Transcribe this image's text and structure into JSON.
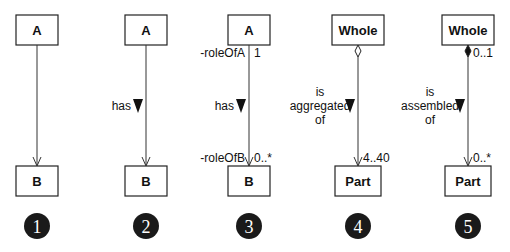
{
  "diagram": {
    "type": "UML association variants",
    "panels": [
      {
        "number": "1",
        "top_class": "A",
        "bottom_class": "B",
        "association_name": "",
        "top_role": "",
        "top_multiplicity": "",
        "bottom_role": "",
        "bottom_multiplicity": "",
        "top_end": "none",
        "bottom_end": "arrow"
      },
      {
        "number": "2",
        "top_class": "A",
        "bottom_class": "B",
        "association_name": [
          "has"
        ],
        "top_role": "",
        "top_multiplicity": "",
        "bottom_role": "",
        "bottom_multiplicity": "",
        "top_end": "none",
        "bottom_end": "arrow"
      },
      {
        "number": "3",
        "top_class": "A",
        "bottom_class": "B",
        "association_name": [
          "has"
        ],
        "top_role": "-roleOfA",
        "top_multiplicity": "1",
        "bottom_role": "-roleOfB",
        "bottom_multiplicity": "0..*",
        "top_end": "none",
        "bottom_end": "arrow"
      },
      {
        "number": "4",
        "top_class": "Whole",
        "bottom_class": "Part",
        "association_name": [
          "is",
          "aggregated",
          "of"
        ],
        "top_role": "",
        "top_multiplicity": "",
        "bottom_role": "",
        "bottom_multiplicity": "4..40",
        "top_end": "hollow-diamond",
        "bottom_end": "arrow"
      },
      {
        "number": "5",
        "top_class": "Whole",
        "bottom_class": "Part",
        "association_name": [
          "is",
          "assembled",
          "of"
        ],
        "top_role": "",
        "top_multiplicity": "0..1",
        "bottom_role": "",
        "bottom_multiplicity": "0..*",
        "top_end": "filled-diamond",
        "bottom_end": "arrow"
      }
    ]
  }
}
